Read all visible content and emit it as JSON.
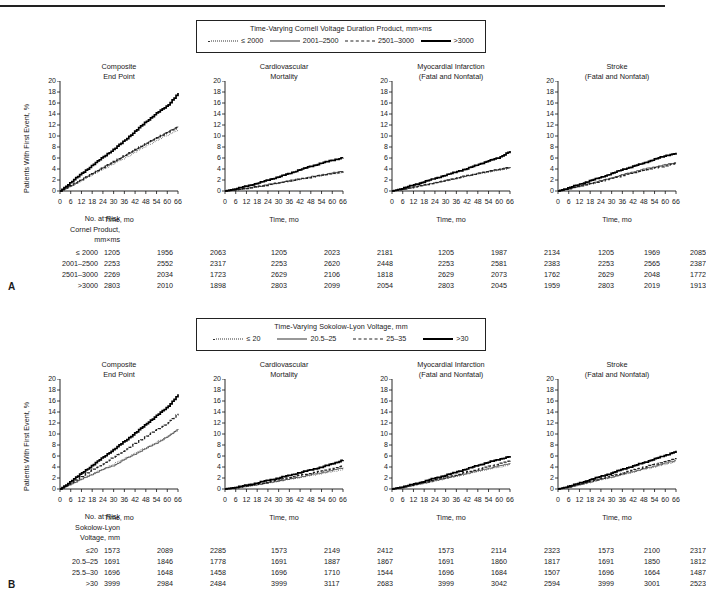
{
  "figure": {
    "y_axis_label": "Patients With First Event, %",
    "x_axis_label": "Time, mo",
    "y_ticks": [
      "0",
      "2",
      "4",
      "6",
      "8",
      "10",
      "12",
      "14",
      "16",
      "18",
      "20"
    ],
    "x_ticks": [
      "0",
      "6",
      "12",
      "18",
      "24",
      "30",
      "36",
      "42",
      "48",
      "54",
      "60",
      "66"
    ],
    "panel_titles": [
      {
        "line1": "Composite",
        "line2": "End Point"
      },
      {
        "line1": "Cardiovascular",
        "line2": "Mortality"
      },
      {
        "line1": "Myocardial Infarction",
        "line2": "(Fatal and Nonfatal)"
      },
      {
        "line1": "Stroke",
        "line2": "(Fatal and Nonfatal)"
      }
    ],
    "risk_header": "No. at Risk"
  },
  "panelA": {
    "letter": "A",
    "legend_title": "Time-Varying Cornell Voltage Duration Product, mm×ms",
    "legend_items": [
      {
        "label": "≤ 2000",
        "style": "dotted"
      },
      {
        "label": "2001–2500",
        "style": "thin"
      },
      {
        "label": "2501–3000",
        "style": "dashed"
      },
      {
        "label": ">3000",
        "style": "thick"
      }
    ],
    "risk_label_line1": "Cornel Product,",
    "risk_label_line2": "mm×ms",
    "risk_rows": [
      {
        "label": "≤ 2000",
        "values": [
          "1205",
          "1956",
          "2063",
          "1205",
          "2023",
          "2181",
          "1205",
          "1987",
          "2134",
          "1205",
          "1969",
          "2085"
        ]
      },
      {
        "label": "2001–2500",
        "values": [
          "2253",
          "2552",
          "2317",
          "2253",
          "2620",
          "2448",
          "2253",
          "2581",
          "2383",
          "2253",
          "2565",
          "2387"
        ]
      },
      {
        "label": "2501–3000",
        "values": [
          "2269",
          "2034",
          "1723",
          "2629",
          "2106",
          "1818",
          "2629",
          "2073",
          "1762",
          "2629",
          "2048",
          "1772"
        ]
      },
      {
        "label": ">3000",
        "values": [
          "2803",
          "2010",
          "1898",
          "2803",
          "2099",
          "2054",
          "2803",
          "2045",
          "1959",
          "2803",
          "2019",
          "1913"
        ]
      }
    ]
  },
  "panelB": {
    "letter": "B",
    "legend_title": "Time-Varying Sokolow-Lyon Voltage, mm",
    "legend_items": [
      {
        "label": "≤ 20",
        "style": "dotted"
      },
      {
        "label": "20.5–25",
        "style": "thin"
      },
      {
        "label": "25–35",
        "style": "dashed"
      },
      {
        "label": ">30",
        "style": "thick"
      }
    ],
    "risk_label_line1": "Sokolow-Lyon",
    "risk_label_line2": "Voltage, mm",
    "risk_rows": [
      {
        "label": "≤20",
        "values": [
          "1573",
          "2089",
          "2285",
          "1573",
          "2149",
          "2412",
          "1573",
          "2114",
          "2323",
          "1573",
          "2100",
          "2317"
        ]
      },
      {
        "label": "20.5–25",
        "values": [
          "1691",
          "1846",
          "1778",
          "1691",
          "1887",
          "1867",
          "1691",
          "1860",
          "1817",
          "1691",
          "1850",
          "1812"
        ]
      },
      {
        "label": "25.5–30",
        "values": [
          "1696",
          "1648",
          "1458",
          "1696",
          "1710",
          "1544",
          "1696",
          "1684",
          "1507",
          "1696",
          "1664",
          "1487"
        ]
      },
      {
        "label": ">30",
        "values": [
          "3999",
          "2984",
          "2484",
          "3999",
          "3117",
          "2683",
          "3999",
          "3042",
          "2594",
          "3999",
          "3001",
          "2523"
        ]
      }
    ]
  },
  "chart_data": [
    {
      "type": "line",
      "panel": "A",
      "title": "Composite End Point",
      "xlabel": "Time, mo",
      "ylabel": "Patients With First Event, %",
      "xlim": [
        0,
        66
      ],
      "ylim": [
        0,
        20
      ],
      "grid": false,
      "x": [
        0,
        6,
        12,
        18,
        24,
        30,
        36,
        42,
        48,
        54,
        60,
        66
      ],
      "series": [
        {
          "name": "≤ 2000",
          "values": [
            0,
            0.9,
            2.0,
            3.0,
            4.0,
            5.0,
            6.0,
            7.1,
            8.2,
            9.2,
            10.2,
            11.2
          ]
        },
        {
          "name": "2001–2500",
          "values": [
            0,
            1.0,
            2.1,
            3.2,
            4.3,
            5.3,
            6.4,
            7.5,
            8.6,
            9.7,
            10.7,
            11.8
          ]
        },
        {
          "name": "2501–3000",
          "values": [
            0,
            1.0,
            2.1,
            3.2,
            4.3,
            5.4,
            6.5,
            7.6,
            8.7,
            9.7,
            10.7,
            11.6
          ]
        },
        {
          "name": ">3000",
          "values": [
            0,
            1.6,
            3.2,
            4.7,
            6.2,
            7.6,
            9.2,
            10.9,
            12.6,
            14.2,
            15.5,
            17.8
          ]
        }
      ]
    },
    {
      "type": "line",
      "panel": "A",
      "title": "Cardiovascular Mortality",
      "xlabel": "Time, mo",
      "ylabel": "Patients With First Event, %",
      "xlim": [
        0,
        66
      ],
      "ylim": [
        0,
        20
      ],
      "grid": false,
      "x": [
        0,
        6,
        12,
        18,
        24,
        30,
        36,
        42,
        48,
        54,
        60,
        66
      ],
      "series": [
        {
          "name": "≤ 2000",
          "values": [
            0,
            0.2,
            0.5,
            0.8,
            1.1,
            1.4,
            1.8,
            2.1,
            2.5,
            2.8,
            3.1,
            3.4
          ]
        },
        {
          "name": "2001–2500",
          "values": [
            0,
            0.2,
            0.5,
            0.8,
            1.2,
            1.5,
            1.9,
            2.2,
            2.6,
            2.9,
            3.3,
            3.6
          ]
        },
        {
          "name": "2501–3000",
          "values": [
            0,
            0.2,
            0.5,
            0.8,
            1.1,
            1.5,
            1.8,
            2.2,
            2.5,
            2.9,
            3.2,
            3.5
          ]
        },
        {
          "name": ">3000",
          "values": [
            0,
            0.4,
            0.9,
            1.4,
            2.0,
            2.6,
            3.2,
            3.9,
            4.5,
            5.1,
            5.6,
            6.1
          ]
        }
      ]
    },
    {
      "type": "line",
      "panel": "A",
      "title": "Myocardial Infarction (Fatal and Nonfatal)",
      "xlabel": "Time, mo",
      "ylabel": "Patients With First Event, %",
      "xlim": [
        0,
        66
      ],
      "ylim": [
        0,
        20
      ],
      "grid": false,
      "x": [
        0,
        6,
        12,
        18,
        24,
        30,
        36,
        42,
        48,
        54,
        60,
        66
      ],
      "series": [
        {
          "name": "≤ 2000",
          "values": [
            0,
            0.3,
            0.7,
            1.1,
            1.5,
            1.9,
            2.3,
            2.7,
            3.1,
            3.4,
            3.8,
            4.1
          ]
        },
        {
          "name": "2001–2500",
          "values": [
            0,
            0.3,
            0.7,
            1.1,
            1.5,
            1.9,
            2.3,
            2.8,
            3.2,
            3.6,
            3.9,
            4.3
          ]
        },
        {
          "name": "2501–3000",
          "values": [
            0,
            0.3,
            0.7,
            1.1,
            1.5,
            1.9,
            2.4,
            2.8,
            3.2,
            3.6,
            4.0,
            4.3
          ]
        },
        {
          "name": ">3000",
          "values": [
            0,
            0.5,
            1.1,
            1.7,
            2.3,
            2.9,
            3.5,
            4.1,
            4.8,
            5.5,
            6.1,
            7.3
          ]
        }
      ]
    },
    {
      "type": "line",
      "panel": "A",
      "title": "Stroke (Fatal and Nonfatal)",
      "xlabel": "Time, mo",
      "ylabel": "Patients With First Event, %",
      "xlim": [
        0,
        66
      ],
      "ylim": [
        0,
        20
      ],
      "grid": false,
      "x": [
        0,
        6,
        12,
        18,
        24,
        30,
        36,
        42,
        48,
        54,
        60,
        66
      ],
      "series": [
        {
          "name": "≤ 2000",
          "values": [
            0,
            0.4,
            0.9,
            1.4,
            1.9,
            2.4,
            2.9,
            3.4,
            3.9,
            4.3,
            4.7,
            5.1
          ]
        },
        {
          "name": "2001–2500",
          "values": [
            0,
            0.4,
            0.9,
            1.4,
            1.9,
            2.4,
            3.0,
            3.5,
            4.0,
            4.4,
            4.8,
            5.2
          ]
        },
        {
          "name": "2501–3000",
          "values": [
            0,
            0.4,
            0.9,
            1.3,
            1.8,
            2.3,
            2.8,
            3.3,
            3.8,
            4.2,
            4.6,
            5.0
          ]
        },
        {
          "name": ">3000",
          "values": [
            0,
            0.6,
            1.2,
            1.9,
            2.5,
            3.2,
            3.9,
            4.5,
            5.1,
            5.8,
            6.4,
            6.9
          ]
        }
      ]
    },
    {
      "type": "line",
      "panel": "B",
      "title": "Composite End Point",
      "xlabel": "Time, mo",
      "ylabel": "Patients With First Event, %",
      "xlim": [
        0,
        66
      ],
      "ylim": [
        0,
        20
      ],
      "grid": false,
      "x": [
        0,
        6,
        12,
        18,
        24,
        30,
        36,
        42,
        48,
        54,
        60,
        66
      ],
      "series": [
        {
          "name": "≤ 20",
          "values": [
            0,
            0.9,
            1.9,
            2.8,
            3.7,
            4.6,
            5.6,
            6.6,
            7.6,
            8.6,
            9.6,
            10.8
          ]
        },
        {
          "name": "20.5–25",
          "values": [
            0,
            0.9,
            1.8,
            2.7,
            3.6,
            4.3,
            5.4,
            6.4,
            7.4,
            8.4,
            9.5,
            11.0
          ]
        },
        {
          "name": "25–35",
          "values": [
            0,
            1.1,
            2.3,
            3.5,
            4.6,
            5.8,
            7.0,
            8.3,
            9.6,
            10.8,
            12.0,
            13.7
          ]
        },
        {
          "name": ">30",
          "values": [
            0,
            1.4,
            2.9,
            4.3,
            5.8,
            7.2,
            8.7,
            10.2,
            11.8,
            13.4,
            14.9,
            17.2
          ]
        }
      ]
    },
    {
      "type": "line",
      "panel": "B",
      "title": "Cardiovascular Mortality",
      "xlabel": "Time, mo",
      "ylabel": "Patients With First Event, %",
      "xlim": [
        0,
        66
      ],
      "ylim": [
        0,
        20
      ],
      "grid": false,
      "x": [
        0,
        6,
        12,
        18,
        24,
        30,
        36,
        42,
        48,
        54,
        60,
        66
      ],
      "series": [
        {
          "name": "≤ 20",
          "values": [
            0,
            0.2,
            0.5,
            0.8,
            1.1,
            1.4,
            1.8,
            2.1,
            2.5,
            2.8,
            3.2,
            3.6
          ]
        },
        {
          "name": "20.5–25",
          "values": [
            0,
            0.2,
            0.5,
            0.8,
            1.1,
            1.5,
            1.8,
            2.2,
            2.6,
            3.0,
            3.4,
            3.9
          ]
        },
        {
          "name": "25–35",
          "values": [
            0,
            0.2,
            0.6,
            0.9,
            1.3,
            1.7,
            2.1,
            2.5,
            2.9,
            3.3,
            3.7,
            4.2
          ]
        },
        {
          "name": ">30",
          "values": [
            0,
            0.3,
            0.7,
            1.1,
            1.6,
            2.0,
            2.5,
            3.0,
            3.5,
            4.0,
            4.6,
            5.3
          ]
        }
      ]
    },
    {
      "type": "line",
      "panel": "B",
      "title": "Myocardial Infarction (Fatal and Nonfatal)",
      "xlabel": "Time, mo",
      "ylabel": "Patients With First Event, %",
      "xlim": [
        0,
        66
      ],
      "ylim": [
        0,
        20
      ],
      "grid": false,
      "x": [
        0,
        6,
        12,
        18,
        24,
        30,
        36,
        42,
        48,
        54,
        60,
        66
      ],
      "series": [
        {
          "name": "≤ 20",
          "values": [
            0,
            0.3,
            0.7,
            1.1,
            1.5,
            1.9,
            2.3,
            2.7,
            3.2,
            3.6,
            4.0,
            4.5
          ]
        },
        {
          "name": "20.5–25",
          "values": [
            0,
            0.3,
            0.7,
            1.1,
            1.5,
            2.0,
            2.4,
            2.9,
            3.3,
            3.8,
            4.2,
            4.7
          ]
        },
        {
          "name": "25–35",
          "values": [
            0,
            0.3,
            0.8,
            1.2,
            1.7,
            2.1,
            2.6,
            3.1,
            3.6,
            4.1,
            4.6,
            5.2
          ]
        },
        {
          "name": ">30",
          "values": [
            0,
            0.4,
            0.9,
            1.4,
            2.0,
            2.5,
            3.1,
            3.7,
            4.3,
            4.9,
            5.4,
            6.0
          ]
        }
      ]
    },
    {
      "type": "line",
      "panel": "B",
      "title": "Stroke (Fatal and Nonfatal)",
      "xlabel": "Time, mo",
      "ylabel": "Patients With First Event, %",
      "xlim": [
        0,
        66
      ],
      "ylim": [
        0,
        20
      ],
      "grid": false,
      "x": [
        0,
        6,
        12,
        18,
        24,
        30,
        36,
        42,
        48,
        54,
        60,
        66
      ],
      "series": [
        {
          "name": "≤ 20",
          "values": [
            0,
            0.3,
            0.8,
            1.2,
            1.7,
            2.1,
            2.6,
            3.1,
            3.6,
            4.0,
            4.5,
            5.0
          ]
        },
        {
          "name": "20.5–25",
          "values": [
            0,
            0.3,
            0.8,
            1.3,
            1.8,
            2.2,
            2.7,
            3.2,
            3.7,
            4.2,
            4.7,
            5.2
          ]
        },
        {
          "name": "25–35",
          "values": [
            0,
            0.4,
            0.9,
            1.4,
            1.9,
            2.4,
            2.9,
            3.5,
            4.0,
            4.5,
            5.0,
            5.6
          ]
        },
        {
          "name": ">30",
          "values": [
            0,
            0.5,
            1.1,
            1.7,
            2.3,
            2.9,
            3.6,
            4.2,
            4.8,
            5.5,
            6.1,
            6.9
          ]
        }
      ]
    }
  ]
}
